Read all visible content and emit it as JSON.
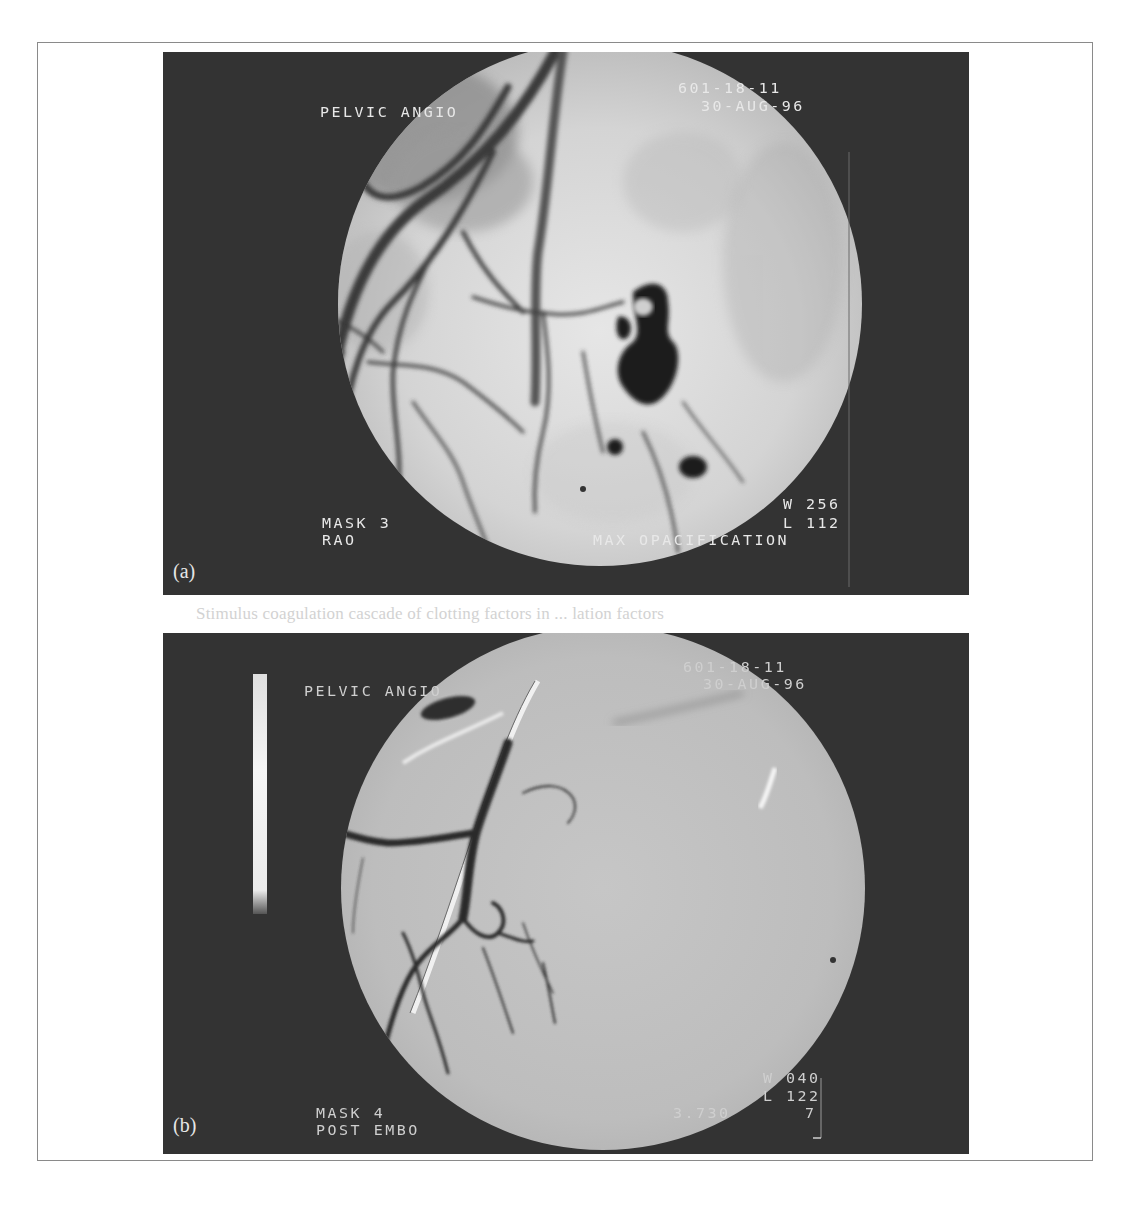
{
  "figure": {
    "show_through_text": "Stimulus coagulation cascade of clotting factors in ... lation factors",
    "panel_a": {
      "label": "(a)",
      "title": "PELVIC ANGIO",
      "id_line": "601-18-11",
      "date": "30-AUG-96",
      "mask": "MASK 3",
      "view": "RAO",
      "window": "W 256",
      "level": "L 112",
      "phase": "MAX OPACIFICATION",
      "colors": {
        "background": "#333333",
        "field_light": "#dcdcdc",
        "vessel": "#2a2a2a",
        "text": "#e8e8e8"
      }
    },
    "panel_b": {
      "label": "(b)",
      "title": "PELVIC ANGIO",
      "id_line": "601-18-11",
      "date": "30-AUG-96",
      "mask": "MASK 4",
      "status": "POST EMBO",
      "window": "W 040",
      "level": "L 122",
      "value": "3.730",
      "frame": "7",
      "colors": {
        "background": "#333333",
        "field": "#bdbdbd",
        "vessel": "#303030",
        "text": "#e0e0e0",
        "scale_bar": "#f2f2f2"
      }
    }
  }
}
